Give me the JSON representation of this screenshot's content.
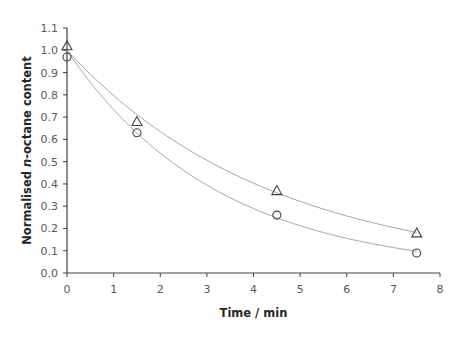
{
  "chart_data": {
    "type": "scatter",
    "title": "",
    "xlabel": "Time / min",
    "ylabel_parts": [
      "Normalised ",
      "n",
      "-octane content"
    ],
    "ylabel": "Normalised n-octane content",
    "xlim": [
      0,
      8
    ],
    "ylim": [
      0,
      1.1
    ],
    "x_ticks": [
      0,
      1,
      2,
      3,
      4,
      5,
      6,
      7,
      8
    ],
    "x_tick_labels": [
      "0",
      "1",
      "2",
      "3",
      "4",
      "5",
      "6",
      "7",
      "8"
    ],
    "y_ticks": [
      0,
      0.1,
      0.2,
      0.3,
      0.4,
      0.5,
      0.6,
      0.7,
      0.8,
      0.9,
      1.0,
      1.1
    ],
    "y_tick_labels": [
      "0.0",
      "0.1",
      "0.2",
      "0.3",
      "0.4",
      "0.5",
      "0.6",
      "0.7",
      "0.8",
      "0.9",
      "1.0",
      "1.1"
    ],
    "grid": false,
    "legend": "none",
    "series": [
      {
        "name": "triangle-series",
        "marker": "triangle",
        "x": [
          0,
          1.5,
          4.5,
          7.5
        ],
        "y": [
          1.02,
          0.68,
          0.37,
          0.18
        ],
        "fit": {
          "type": "exponential",
          "a": 1.0,
          "k": 0.227,
          "x_range": [
            0,
            7.5
          ]
        }
      },
      {
        "name": "circle-series",
        "marker": "circle",
        "x": [
          0,
          1.5,
          4.5,
          7.5
        ],
        "y": [
          0.97,
          0.63,
          0.26,
          0.09
        ],
        "fit": {
          "type": "exponential",
          "a": 1.0,
          "k": 0.31,
          "x_range": [
            0,
            7.5
          ]
        }
      }
    ],
    "colors": {
      "axis": "#404040",
      "fit_line": "#a6a6a6",
      "marker": "#404040",
      "tick_label": "#595959"
    }
  }
}
